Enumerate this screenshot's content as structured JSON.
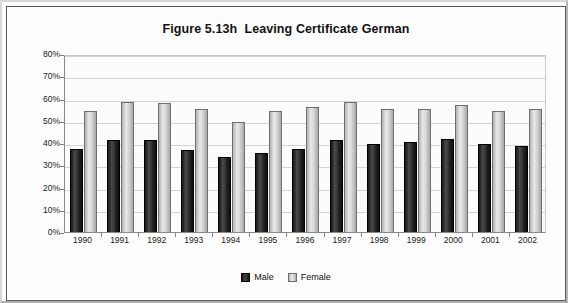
{
  "chart_data": {
    "type": "bar",
    "title": "Figure 5.13h  Leaving Certificate German",
    "xlabel": "",
    "ylabel": "",
    "ylim": [
      0,
      80
    ],
    "ytick_labels": [
      "80%",
      "70%",
      "60%",
      "50%",
      "40%",
      "30%",
      "20%",
      "10%",
      "0%"
    ],
    "ytick_values": [
      80,
      70,
      60,
      50,
      40,
      30,
      20,
      10,
      0
    ],
    "grid": true,
    "legend_position": "bottom",
    "categories": [
      "1990",
      "1991",
      "1992",
      "1993",
      "1994",
      "1995",
      "1996",
      "1997",
      "1998",
      "1999",
      "2000",
      "2001",
      "2002"
    ],
    "series": [
      {
        "name": "Male",
        "color": "#1f1f1f",
        "values": [
          37.5,
          41.5,
          41.5,
          37,
          33.5,
          35.5,
          37.5,
          41.5,
          39.5,
          40.5,
          42,
          39.5,
          38.5
        ]
      },
      {
        "name": "Female",
        "color": "#d9d9d9",
        "values": [
          54.5,
          58.5,
          58,
          55.5,
          49.5,
          54.5,
          56,
          58.5,
          55.5,
          55.5,
          57,
          54.5,
          55.5
        ]
      }
    ]
  },
  "legend": {
    "items": [
      {
        "label": "Male",
        "swatch": "male"
      },
      {
        "label": "Female",
        "swatch": "female"
      }
    ]
  },
  "colors": {
    "male_bar": "#1f1f1f",
    "female_bar": "#d9d9d9",
    "gridline": "#d3d3d3",
    "axis": "#8a8a8a",
    "plot_background": "#fcfcfc",
    "frame": "#5a5a5a"
  }
}
